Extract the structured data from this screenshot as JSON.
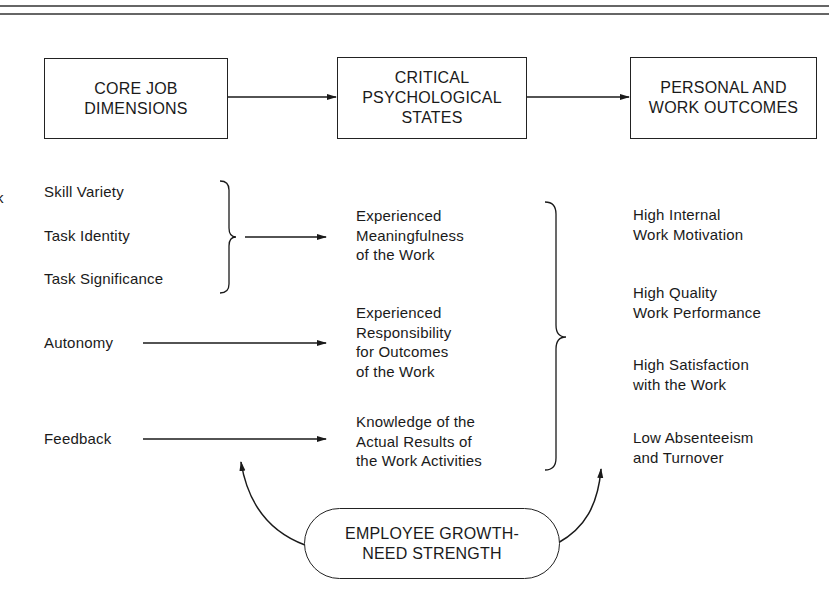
{
  "diagram": {
    "header_boxes": [
      {
        "id": "core-job-dimensions",
        "label": "CORE JOB\nDIMENSIONS"
      },
      {
        "id": "critical-psychological-states",
        "label": "CRITICAL\nPSYCHOLOGICAL\nSTATES"
      },
      {
        "id": "personal-work-outcomes",
        "label": "PERSONAL AND\nWORK OUTCOMES"
      }
    ],
    "edge_fragment": "k",
    "core_dimensions": [
      {
        "label": "Skill Variety"
      },
      {
        "label": "Task Identity"
      },
      {
        "label": "Task Significance"
      },
      {
        "label": "Autonomy"
      },
      {
        "label": "Feedback"
      }
    ],
    "psychological_states": [
      {
        "label": "Experienced\nMeaningfulness\nof the Work"
      },
      {
        "label": "Experienced\nResponsibility\nfor Outcomes\nof the Work"
      },
      {
        "label": "Knowledge of the\nActual Results of\nthe Work Activities"
      }
    ],
    "outcomes": [
      {
        "label": "High Internal\nWork Motivation"
      },
      {
        "label": "High Quality\nWork Performance"
      },
      {
        "label": "High Satisfaction\nwith the Work"
      },
      {
        "label": "Low Absenteeism\nand Turnover"
      }
    ],
    "moderator": {
      "label": "EMPLOYEE GROWTH-\nNEED STRENGTH"
    },
    "colors": {
      "ink": "#1a1a1a",
      "background": "#ffffff"
    }
  }
}
